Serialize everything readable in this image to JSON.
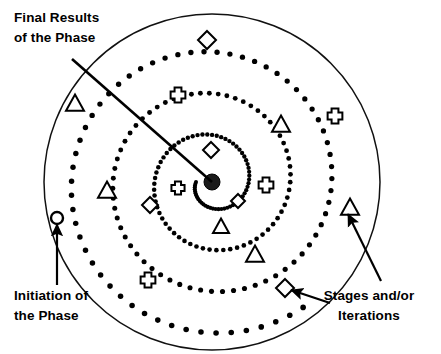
{
  "figure": {
    "background_color": "#ffffff",
    "ink_color": "#000000",
    "width": 441,
    "height": 354
  },
  "annotations": [
    {
      "id": "final-results",
      "line1": "Final Results",
      "line2": "of the Phase",
      "text_x": 14,
      "text_y": 22,
      "points_to": "outer-circle-upper-left-crossing"
    },
    {
      "id": "initiation",
      "line1": "Initiation of",
      "line2": "the Phase",
      "text_x": 14,
      "text_y": 300,
      "points_to": "spiral-start-circle"
    },
    {
      "id": "stages-iterations",
      "line1": "Stages and/or",
      "line2": "Iterations",
      "text_x": 369,
      "text_y": 300,
      "points_to": "spiral-markers"
    }
  ],
  "geometry": {
    "center": {
      "x": 212,
      "y": 182
    },
    "outer_circle_radius": 168,
    "spiral_turns": 3.35,
    "spiral_dot_radius": 2.6,
    "spiral_dot_count": 210,
    "spiral_start_angle_deg": 180,
    "spiral_min_radius": 16,
    "spiral_max_radius": 155,
    "ray": {
      "from_x": 212,
      "from_y": 182,
      "to_x": 72,
      "to_y": 59
    },
    "start_circle": {
      "x": 57,
      "y": 218,
      "r": 6
    }
  },
  "markers": [
    {
      "shape": "diamond",
      "x": 207,
      "y": 40,
      "size": 9
    },
    {
      "shape": "clover",
      "x": 335,
      "y": 116,
      "size": 9
    },
    {
      "shape": "triangle",
      "x": 281,
      "y": 125,
      "size": 9
    },
    {
      "shape": "triangle",
      "x": 75,
      "y": 104,
      "size": 9
    },
    {
      "shape": "clover",
      "x": 178,
      "y": 95,
      "size": 9
    },
    {
      "shape": "diamond",
      "x": 211,
      "y": 150,
      "size": 8
    },
    {
      "shape": "clover",
      "x": 266,
      "y": 185,
      "size": 9
    },
    {
      "shape": "clover",
      "x": 178,
      "y": 188,
      "size": 8
    },
    {
      "shape": "diamond",
      "x": 238,
      "y": 201,
      "size": 7
    },
    {
      "shape": "triangle",
      "x": 221,
      "y": 227,
      "size": 8
    },
    {
      "shape": "diamond",
      "x": 150,
      "y": 205,
      "size": 8
    },
    {
      "shape": "triangle",
      "x": 107,
      "y": 191,
      "size": 9
    },
    {
      "shape": "triangle",
      "x": 255,
      "y": 255,
      "size": 9
    },
    {
      "shape": "clover",
      "x": 148,
      "y": 280,
      "size": 9
    },
    {
      "shape": "diamond",
      "x": 285,
      "y": 288,
      "size": 9
    },
    {
      "shape": "triangle",
      "x": 350,
      "y": 208,
      "size": 9
    }
  ],
  "arrows": [
    {
      "id": "initiation-arrow",
      "x1": 57,
      "y1": 285,
      "x2": 57,
      "y2": 224
    },
    {
      "id": "stages-arrow-upper",
      "x1": 381,
      "y1": 281,
      "x2": 348,
      "y2": 214
    },
    {
      "id": "stages-arrow-lower",
      "x1": 330,
      "y1": 303,
      "x2": 291,
      "y2": 290
    }
  ]
}
